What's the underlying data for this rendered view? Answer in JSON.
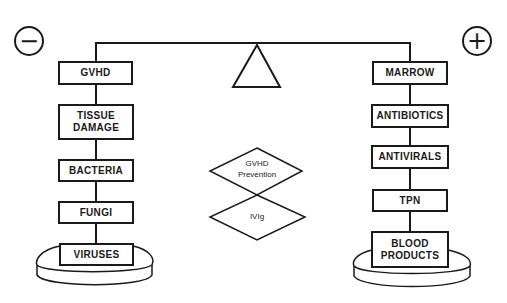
{
  "diagram": {
    "type": "balance-scale",
    "left_sign": "−",
    "right_sign": "+",
    "left_column": {
      "items": [
        "GVHD",
        "TISSUE\nDAMAGE",
        "BACTERIA",
        "FUNGI",
        "VIRUSES"
      ]
    },
    "right_column": {
      "items": [
        "MARROW",
        "ANTIBIOTICS",
        "ANTIVIRALS",
        "TPN",
        "BLOOD\nPRODUCTS"
      ]
    },
    "center": {
      "diamond_top": "GVHD\nPrevention",
      "diamond_bottom": "IVIg"
    },
    "colors": {
      "line": "#1a1a1a",
      "background": "#ffffff"
    }
  }
}
